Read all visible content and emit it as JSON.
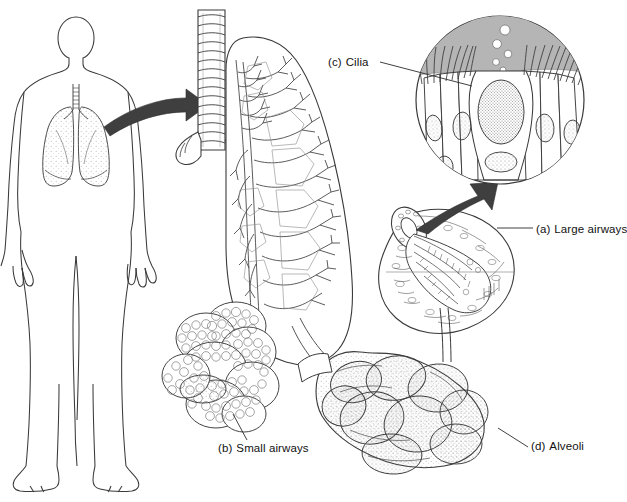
{
  "figure": {
    "background_color": "#ffffff",
    "line_color": "#2b2b2b",
    "arrow_color": "#3a3a3a",
    "mucus_color": "#b3b3b3",
    "stipple_color": "#8d8d8d"
  },
  "labels": {
    "cilia": {
      "tag": "(c)",
      "text": "Cilia"
    },
    "large_airways": {
      "tag": "(a)",
      "text": "Large airways"
    },
    "small_airways": {
      "tag": "(b)",
      "text": "Small airways"
    },
    "alveoli": {
      "tag": "(d)",
      "text": "Alveoli"
    }
  },
  "parts": {
    "human_figure": "human-body-outline-with-lungs",
    "trachea": "trachea-with-cartilage-rings",
    "bronchial_tree": "bronchial-tree-in-lung-silhouette",
    "airway_cross_section": "large-airway-cutaway",
    "cilia_inset": "ciliated-epithelium-circle-inset",
    "small_airway_cluster": "small-airway-sac-cluster",
    "alveoli_cluster": "alveolar-lobed-cluster",
    "arrow_body_to_trachea": "curved-arrow-right",
    "arrow_airway_to_cilia": "curved-arrow-up-right"
  }
}
